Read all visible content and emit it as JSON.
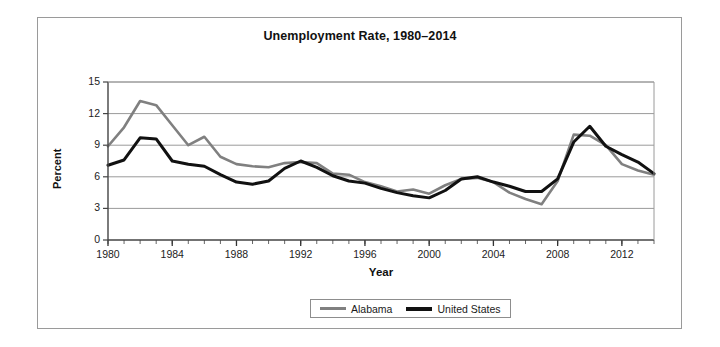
{
  "figure": {
    "width": 720,
    "height": 347,
    "background": "#ffffff",
    "frame_color": "#9a9a9a"
  },
  "chart_data": {
    "type": "line",
    "title": "Unemployment Rate, 1980–2014",
    "xlabel": "Year",
    "ylabel": "Percent",
    "xlim": [
      1980,
      2014
    ],
    "ylim": [
      0,
      15
    ],
    "yticks": [
      0,
      3,
      6,
      9,
      12,
      15
    ],
    "ytick_labels": [
      "0",
      "3",
      "6",
      "9",
      "12",
      "15"
    ],
    "xticks": [
      1980,
      1984,
      1988,
      1992,
      1996,
      2000,
      2004,
      2008,
      2012
    ],
    "xtick_labels": [
      "1980",
      "1984",
      "1988",
      "1992",
      "1996",
      "2000",
      "2004",
      "2008",
      "2012"
    ],
    "minor_xticks_interval": 1,
    "grid": "horizontal",
    "grid_color": "#9a9a9a",
    "legend_position": "bottom-center",
    "x": [
      1980,
      1981,
      1982,
      1983,
      1984,
      1985,
      1986,
      1987,
      1988,
      1989,
      1990,
      1991,
      1992,
      1993,
      1994,
      1995,
      1996,
      1997,
      1998,
      1999,
      2000,
      2001,
      2002,
      2003,
      2004,
      2005,
      2006,
      2007,
      2008,
      2009,
      2010,
      2011,
      2012,
      2013,
      2014
    ],
    "series": [
      {
        "name": "Alabama",
        "color": "#808080",
        "width": 2.6,
        "values": [
          8.9,
          10.7,
          13.2,
          12.8,
          10.9,
          9.0,
          9.8,
          7.9,
          7.2,
          7.0,
          6.9,
          7.3,
          7.4,
          7.3,
          6.3,
          6.2,
          5.5,
          5.1,
          4.6,
          4.8,
          4.4,
          5.2,
          5.8,
          5.9,
          5.5,
          4.5,
          3.9,
          3.4,
          5.6,
          10.0,
          9.9,
          9.0,
          7.2,
          6.6,
          6.2
        ]
      },
      {
        "name": "United States",
        "color": "#111111",
        "width": 3.0,
        "values": [
          7.1,
          7.6,
          9.7,
          9.6,
          7.5,
          7.2,
          7.0,
          6.2,
          5.5,
          5.3,
          5.6,
          6.8,
          7.5,
          6.9,
          6.1,
          5.6,
          5.4,
          4.9,
          4.5,
          4.2,
          4.0,
          4.7,
          5.8,
          6.0,
          5.5,
          5.1,
          4.6,
          4.6,
          5.8,
          9.3,
          10.8,
          8.9,
          8.1,
          7.4,
          6.3
        ]
      }
    ]
  },
  "legend": {
    "items": [
      {
        "label": "Alabama",
        "color": "#808080"
      },
      {
        "label": "United States",
        "color": "#111111"
      }
    ]
  }
}
